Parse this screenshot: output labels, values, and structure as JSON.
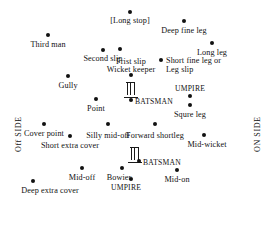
{
  "diagram": {
    "side_labels": {
      "off": "Off SIDE",
      "on": "ON SIDE"
    },
    "positions": [
      {
        "key": "long-stop",
        "label": "[Long stop]",
        "dot_x": 130,
        "dot_y": 12,
        "label_x": 130,
        "label_y": 16,
        "align": "center"
      },
      {
        "key": "deep-fine-leg",
        "label": "Deep fine leg",
        "dot_x": 184,
        "dot_y": 21,
        "label_x": 184,
        "label_y": 26,
        "align": "center"
      },
      {
        "key": "third-man",
        "label": "Third man",
        "dot_x": 48,
        "dot_y": 35,
        "label_x": 48,
        "label_y": 40,
        "align": "center"
      },
      {
        "key": "long-leg",
        "label": "Long leg",
        "dot_x": 212,
        "dot_y": 43,
        "label_x": 212,
        "label_y": 48,
        "align": "center"
      },
      {
        "key": "second-slip",
        "label": "Second slip",
        "dot_x": 103,
        "dot_y": 50,
        "label_x": 103,
        "label_y": 54,
        "align": "center"
      },
      {
        "key": "first-slip",
        "label": "Frist slip",
        "dot_x": 120,
        "dot_y": 49,
        "label_x": 131,
        "label_y": 57,
        "align": "center"
      },
      {
        "key": "short-fine-leg",
        "label": "Short fine leg or Leg slip",
        "dot_x": 161,
        "dot_y": 60,
        "label_x": 166,
        "label_y": 56,
        "align": "wrap"
      },
      {
        "key": "wicket-keeper",
        "label": "Wicket keeper",
        "dot_x": 131,
        "dot_y": 75,
        "label_x": 131,
        "label_y": 65,
        "align": "center"
      },
      {
        "key": "gully",
        "label": "Gully",
        "dot_x": 68,
        "dot_y": 76,
        "label_x": 68,
        "label_y": 81,
        "align": "center"
      },
      {
        "key": "umpire-top",
        "label": "UMPIRE",
        "dot_x": 190,
        "dot_y": 96,
        "label_x": 190,
        "label_y": 84,
        "align": "center"
      },
      {
        "key": "point",
        "label": "Point",
        "dot_x": 96,
        "dot_y": 99,
        "label_x": 96,
        "label_y": 104,
        "align": "center"
      },
      {
        "key": "batsman-top",
        "label": "BATSMAN",
        "dot_x": 131,
        "dot_y": 100,
        "label_x": 135,
        "label_y": 97,
        "align": "left"
      },
      {
        "key": "square-leg",
        "label": "Squre leg",
        "dot_x": 190,
        "dot_y": 105,
        "label_x": 190,
        "label_y": 110,
        "align": "center"
      },
      {
        "key": "cover-point",
        "label": "Cover point",
        "dot_x": 44,
        "dot_y": 124,
        "label_x": 44,
        "label_y": 129,
        "align": "center"
      },
      {
        "key": "silly-mid-off",
        "label": "Silly mid-off",
        "dot_x": 108,
        "dot_y": 124,
        "label_x": 108,
        "label_y": 131,
        "align": "center"
      },
      {
        "key": "forward-short-leg",
        "label": "Forward shortleg",
        "dot_x": 155,
        "dot_y": 124,
        "label_x": 155,
        "label_y": 131,
        "align": "center"
      },
      {
        "key": "short-extra-cover",
        "label": "Short extra cover",
        "dot_x": 70,
        "dot_y": 136,
        "label_x": 70,
        "label_y": 141,
        "align": "center"
      },
      {
        "key": "mid-wicket",
        "label": "Mid-wicket",
        "dot_x": 204,
        "dot_y": 135,
        "label_x": 207,
        "label_y": 140,
        "align": "center"
      },
      {
        "key": "mid-off",
        "label": "Mid-off",
        "dot_x": 82,
        "dot_y": 168,
        "label_x": 82,
        "label_y": 173,
        "align": "center"
      },
      {
        "key": "bowler",
        "label": "Bowier",
        "dot_x": 122,
        "dot_y": 168,
        "label_x": 119,
        "label_y": 173,
        "align": "center"
      },
      {
        "key": "batsman-bottom",
        "label": "BATSMAN",
        "dot_x": 139,
        "dot_y": 161,
        "label_x": 143,
        "label_y": 158,
        "align": "left"
      },
      {
        "key": "mid-on",
        "label": "Mid-on",
        "dot_x": 177,
        "dot_y": 170,
        "label_x": 177,
        "label_y": 175,
        "align": "center"
      },
      {
        "key": "umpire-bottom",
        "label": "UMPIRE",
        "dot_x": 131,
        "dot_y": 179,
        "label_x": 126,
        "label_y": 183,
        "align": "center"
      },
      {
        "key": "deep-extra-cover",
        "label": "Deep extra cover",
        "dot_x": 33,
        "dot_y": 181,
        "label_x": 50,
        "label_y": 186,
        "align": "center"
      }
    ],
    "wickets": [
      {
        "key": "wicket-top",
        "x": 126,
        "y": 82
      },
      {
        "key": "wicket-bottom",
        "x": 130,
        "y": 147
      }
    ]
  }
}
